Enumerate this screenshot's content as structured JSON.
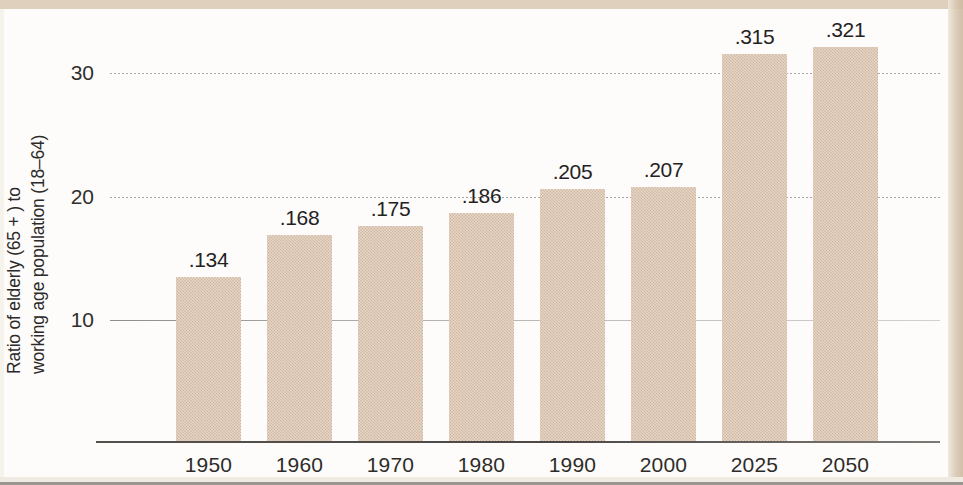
{
  "chart_data": {
    "type": "bar",
    "title": "",
    "subtitle": "",
    "xlabel": "",
    "ylabel": "Ratio of elderly (65 + ) to working age population (18–64)",
    "ylabel_lines": [
      "Ratio of elderly (65 + ) to",
      "working age population (18–64)"
    ],
    "categories": [
      "1950",
      "1960",
      "1970",
      "1980",
      "1990",
      "2000",
      "2025",
      "2050"
    ],
    "values": [
      13.4,
      16.8,
      17.5,
      18.6,
      20.5,
      20.7,
      31.5,
      32.1
    ],
    "data_labels": [
      ".134",
      ".168",
      ".175",
      ".186",
      ".205",
      ".207",
      ".315",
      ".321"
    ],
    "ylim": [
      0,
      34.5
    ],
    "yticks": [
      10,
      20,
      30
    ],
    "ytick_labels": [
      "10",
      "20",
      "30"
    ],
    "grid": true,
    "grid_axis": "y",
    "legend": false,
    "legend_position": "none",
    "bar_color": "#cdb096",
    "axis_color": "#4b4845",
    "text_color": "#2c2a28",
    "background_color": "#fdfcfa",
    "note": "Data labels are printed as decimal ratios (e.g. .134) while the y-axis is scaled in percent (e.g. 10, 20, 30)."
  },
  "series_meta": {
    "count": 8,
    "units": "ratio of persons 65+ per person aged 18–64",
    "min_label": ".134",
    "max_label": ".321"
  }
}
